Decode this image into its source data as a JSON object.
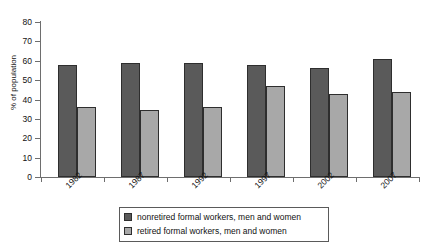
{
  "chart_data": {
    "type": "bar",
    "title": "",
    "xlabel": "",
    "ylabel": "% of population",
    "categories": [
      "1982",
      "1987",
      "1992",
      "1997",
      "2002",
      "2007"
    ],
    "series": [
      {
        "name": "nonretired formal workers, men and women",
        "color": "#5a5a5a",
        "values": [
          58,
          59,
          59,
          58,
          56.5,
          61
        ]
      },
      {
        "name": "retired formal workers, men and women",
        "color": "#a8a8a8",
        "values": [
          36,
          34.5,
          36,
          47,
          43,
          44
        ]
      }
    ],
    "ylim": [
      0,
      80
    ],
    "yticks": [
      0,
      10,
      20,
      30,
      40,
      50,
      60,
      70,
      80
    ],
    "ytick_labels": [
      "0",
      "10",
      "20",
      "30",
      "40",
      "50",
      "60",
      "70",
      "80"
    ],
    "grid": false,
    "legend_position": "bottom"
  },
  "legend": {
    "entries": [
      "nonretired formal workers, men and women",
      "retired formal workers, men and women"
    ]
  },
  "title_sliver": "",
  "axis": {
    "y_title": "% of population"
  }
}
